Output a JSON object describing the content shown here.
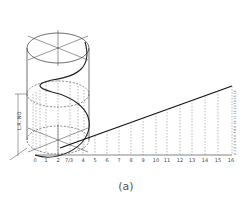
{
  "figure": {
    "caption": "(a)",
    "dimension_label": "L.R. NO",
    "baseline_labels": [
      "0",
      "1",
      "2",
      "7/3",
      "4",
      "5",
      "6",
      "7",
      "8",
      "9",
      "10",
      "11",
      "12",
      "13",
      "14",
      "15",
      "16"
    ],
    "vertical_scale_labels": [
      "0",
      "1",
      "2",
      "3",
      "4",
      "5",
      "6",
      "7",
      "8",
      "9",
      "10",
      "11",
      "12",
      "13",
      "14",
      "15",
      "16"
    ],
    "colors": {
      "line": "#222222",
      "dashed": "#777777",
      "text": "#444444"
    }
  }
}
